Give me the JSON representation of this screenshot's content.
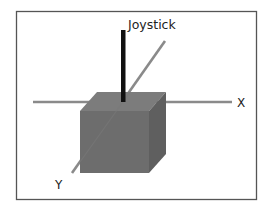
{
  "diagram": {
    "labels": {
      "joystick": "Joystick",
      "x_axis": "X",
      "y_axis": "Y"
    },
    "colors": {
      "frame": "#555555",
      "axis": "#8a8a8a",
      "joystick": "#111111",
      "cube_front": "#6d6d6d",
      "cube_top": "#7c7c7c",
      "cube_side": "#5f5f5f",
      "text": "#222222"
    }
  }
}
